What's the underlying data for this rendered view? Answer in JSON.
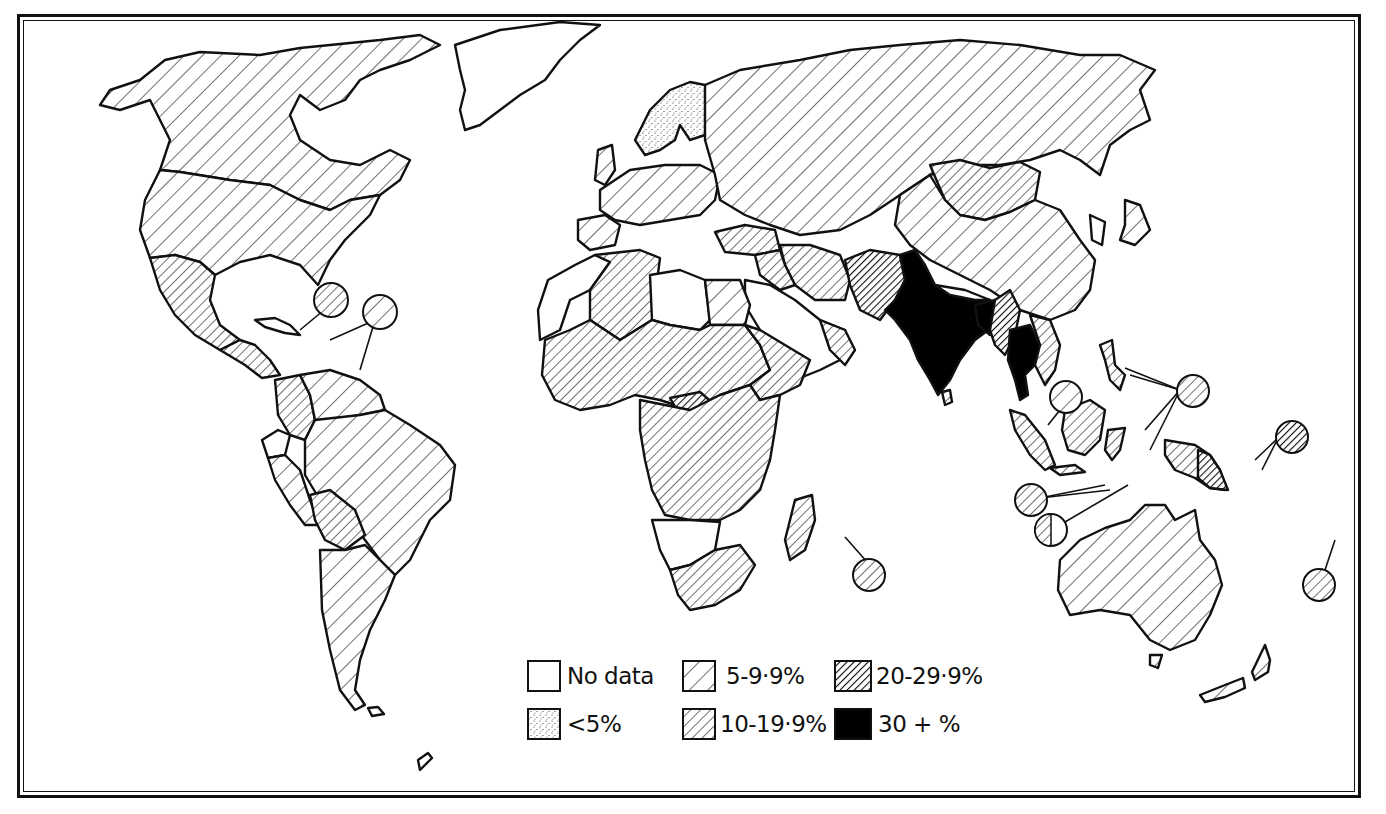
{
  "map": {
    "type": "choropleth world map",
    "projection": "world outline, equatorial view",
    "colors": {
      "ink": "#111111",
      "paper": "#ffffff"
    },
    "legend": {
      "items": [
        {
          "id": "no_data",
          "label": "No data",
          "pattern": "blank"
        },
        {
          "id": "lt5",
          "label": "<5%",
          "pattern": "stipple"
        },
        {
          "id": "5_9",
          "label": "5-9·9%",
          "pattern": "sparse-hatch"
        },
        {
          "id": "10_19",
          "label": "10-19·9%",
          "pattern": "medium-hatch"
        },
        {
          "id": "20_29",
          "label": "20-29·9%",
          "pattern": "dense-hatch"
        },
        {
          "id": "30plus",
          "label": "30 + %",
          "pattern": "solid-black"
        }
      ]
    },
    "regions": [
      {
        "name": "Canada",
        "class": "5_9"
      },
      {
        "name": "Alaska / USA",
        "class": "5_9"
      },
      {
        "name": "Greenland",
        "class": "no_data"
      },
      {
        "name": "Mexico",
        "class": "10_19"
      },
      {
        "name": "Central America",
        "class": "10_19"
      },
      {
        "name": "Caribbean inset 1",
        "class": "10_19"
      },
      {
        "name": "Caribbean inset 2",
        "class": "5_9"
      },
      {
        "name": "Colombia",
        "class": "10_19"
      },
      {
        "name": "Brazil",
        "class": "5_9"
      },
      {
        "name": "Bolivia",
        "class": "10_19"
      },
      {
        "name": "Peru",
        "class": "5_9"
      },
      {
        "name": "Ecuador",
        "class": "no_data"
      },
      {
        "name": "Argentina / Chile",
        "class": "5_9"
      },
      {
        "name": "Scandinavia",
        "class": "lt5"
      },
      {
        "name": "Western Europe",
        "class": "5_9"
      },
      {
        "name": "USSR",
        "class": "5_9"
      },
      {
        "name": "Libya",
        "class": "no_data"
      },
      {
        "name": "Algeria",
        "class": "10_19"
      },
      {
        "name": "Egypt",
        "class": "5_9"
      },
      {
        "name": "Sahel / West Africa",
        "class": "10_19"
      },
      {
        "name": "Central African Republic",
        "class": "20_29"
      },
      {
        "name": "East Africa",
        "class": "10_19"
      },
      {
        "name": "Namibia / Botswana",
        "class": "no_data"
      },
      {
        "name": "South Africa",
        "class": "10_19"
      },
      {
        "name": "Madagascar",
        "class": "10_19"
      },
      {
        "name": "Mauritius inset",
        "class": "10_19"
      },
      {
        "name": "Saudi Arabia",
        "class": "no_data"
      },
      {
        "name": "Iran",
        "class": "10_19"
      },
      {
        "name": "Turkey",
        "class": "10_19"
      },
      {
        "name": "Afghanistan / Pakistan",
        "class": "20_29"
      },
      {
        "name": "India",
        "class": "30plus"
      },
      {
        "name": "Bangladesh",
        "class": "30plus"
      },
      {
        "name": "Nepal",
        "class": "no_data"
      },
      {
        "name": "Burma",
        "class": "20_29"
      },
      {
        "name": "Thailand",
        "class": "30plus"
      },
      {
        "name": "Vietnam / Laos",
        "class": "10_19"
      },
      {
        "name": "Sri Lanka",
        "class": "10_19"
      },
      {
        "name": "China",
        "class": "5_9"
      },
      {
        "name": "Mongolia",
        "class": "10_19"
      },
      {
        "name": "Japan",
        "class": "5_9"
      },
      {
        "name": "Indonesia",
        "class": "10_19"
      },
      {
        "name": "Papua New Guinea",
        "class": "20_29"
      },
      {
        "name": "Philippines inset",
        "class": "10_19"
      },
      {
        "name": "Malaysia inset",
        "class": "5_9"
      },
      {
        "name": "Pacific inset (Solomons)",
        "class": "20_29"
      },
      {
        "name": "Timor inset",
        "class": "mixed"
      },
      {
        "name": "Lesser Sunda inset",
        "class": "10_19"
      },
      {
        "name": "Fiji inset",
        "class": "10_19"
      },
      {
        "name": "Australia",
        "class": "5_9"
      },
      {
        "name": "New Zealand",
        "class": "5_9"
      }
    ]
  }
}
